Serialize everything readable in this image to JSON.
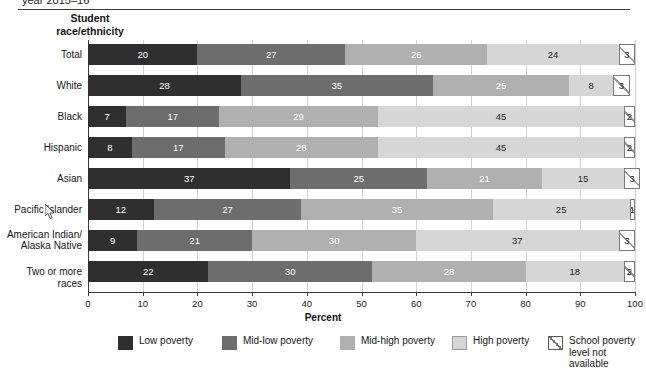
{
  "title": {
    "text": "year 2015–16"
  },
  "axis_header": "Student\nrace/ethnicity",
  "xlabel": "Percent",
  "xticks": [
    "0",
    "10",
    "20",
    "30",
    "40",
    "50",
    "60",
    "70",
    "80",
    "90",
    "100"
  ],
  "legend": [
    {
      "name": "low-poverty",
      "label": "Low poverty",
      "color": "#2f2f2f"
    },
    {
      "name": "mid-low-poverty",
      "label": "Mid-low poverty",
      "color": "#6d6d6d"
    },
    {
      "name": "mid-high-poverty",
      "label": "Mid-high poverty",
      "color": "#b0b0b0"
    },
    {
      "name": "high-poverty",
      "label": "High poverty",
      "color": "#d6d6d6"
    },
    {
      "name": "not-available",
      "label": "School poverty\nlevel not available",
      "color": "#ffffff"
    }
  ],
  "chart_data": {
    "type": "bar",
    "orientation": "horizontal",
    "stacked": true,
    "title": "year 2015–16",
    "xlabel": "Percent",
    "ylabel": "Student race/ethnicity",
    "xlim": [
      0,
      100
    ],
    "grid": true,
    "legend_position": "bottom",
    "categories": [
      "Total",
      "White",
      "Black",
      "Hispanic",
      "Asian",
      "Pacific Islander",
      "American Indian/\nAlaska Native",
      "Two or more races"
    ],
    "series": [
      {
        "name": "Low poverty",
        "values": [
          20,
          28,
          7,
          8,
          37,
          12,
          9,
          22
        ]
      },
      {
        "name": "Mid-low poverty",
        "values": [
          27,
          35,
          17,
          17,
          25,
          27,
          21,
          30
        ]
      },
      {
        "name": "Mid-high poverty",
        "values": [
          26,
          25,
          29,
          28,
          21,
          35,
          30,
          28
        ]
      },
      {
        "name": "High poverty",
        "values": [
          24,
          8,
          45,
          45,
          15,
          25,
          37,
          18
        ]
      },
      {
        "name": "School poverty level not available",
        "values": [
          3,
          3,
          2,
          2,
          3,
          1,
          3,
          2
        ]
      }
    ]
  }
}
